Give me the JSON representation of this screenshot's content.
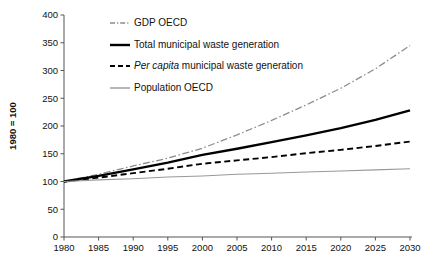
{
  "chart_data": {
    "type": "line",
    "title": "",
    "subtitle": "",
    "xlabel": "",
    "ylabel": "1980 = 100",
    "xlim": [
      1980,
      2030
    ],
    "ylim": [
      0,
      400
    ],
    "grid": false,
    "legend_position": "top-left-inside",
    "x": [
      1980,
      1985,
      1990,
      1995,
      2000,
      2005,
      2010,
      2015,
      2020,
      2025,
      2030
    ],
    "xticks": [
      "1980",
      "1985",
      "1990",
      "1995",
      "2000",
      "2005",
      "2010",
      "2015",
      "2020",
      "2025",
      "2030"
    ],
    "yticks": [
      "0",
      "50",
      "100",
      "150",
      "200",
      "250",
      "300",
      "350",
      "400"
    ],
    "series": [
      {
        "name": "GDP OECD",
        "style": "dash-dot",
        "color": "#8c8c8c",
        "width": 1.3,
        "values": [
          100,
          113,
          128,
          142,
          160,
          184,
          210,
          238,
          268,
          303,
          345
        ]
      },
      {
        "name": "Total municipal waste generation",
        "style": "solid",
        "color": "#000000",
        "width": 2.3,
        "values": [
          100,
          110,
          122,
          134,
          148,
          159,
          171,
          183,
          196,
          211,
          228
        ]
      },
      {
        "name": "Per capita municipal waste generation",
        "style": "dashed",
        "color": "#000000",
        "width": 1.9,
        "values": [
          100,
          107,
          115,
          123,
          132,
          138,
          144,
          151,
          157,
          164,
          172
        ]
      },
      {
        "name": "Population OECD",
        "style": "solid",
        "color": "#999999",
        "width": 1.1,
        "values": [
          100,
          103,
          105,
          108,
          110,
          113,
          115,
          117,
          119,
          121,
          123
        ]
      }
    ],
    "legend": [
      {
        "label": "GDP OECD",
        "italic_prefix": "",
        "style": "dash-dot",
        "color": "#8c8c8c"
      },
      {
        "label": "Total municipal waste generation",
        "italic_prefix": "",
        "style": "solid-thick",
        "color": "#000000"
      },
      {
        "label": " municipal waste generation",
        "italic_prefix": "Per capita",
        "style": "dashed",
        "color": "#000000"
      },
      {
        "label": "Population OECD",
        "italic_prefix": "",
        "style": "solid-thin",
        "color": "#999999"
      }
    ]
  }
}
